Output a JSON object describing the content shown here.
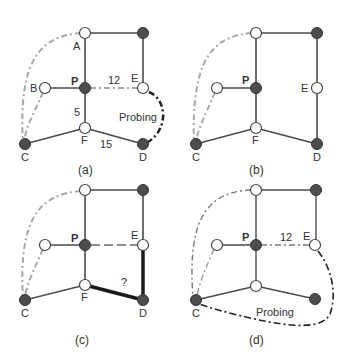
{
  "colors": {
    "edge": "#4a4a4a",
    "edge_thick": "#1a1a1a",
    "dashed_gray": "#a8a8a8",
    "probing": "#222222",
    "node_dark": "#4d4d4d",
    "node_light": "#ffffff",
    "node_stroke": "#444444"
  },
  "panels": [
    {
      "id": "a",
      "caption": "(a)",
      "labels": {
        "A": "A",
        "B": "B",
        "P": "P",
        "E": "E",
        "C": "C",
        "F": "F",
        "D": "D"
      },
      "edge_weights": {
        "P_E": "12",
        "P_F": "5",
        "F_D": "15"
      },
      "annotation": "Probing"
    },
    {
      "id": "b",
      "caption": "(b)",
      "labels": {
        "P": "P",
        "E": "E",
        "C": "C",
        "F": "F",
        "D": "D"
      }
    },
    {
      "id": "c",
      "caption": "(c)",
      "labels": {
        "P": "P",
        "E": "E",
        "C": "C",
        "F": "F",
        "D": "D"
      },
      "annotation": "?"
    },
    {
      "id": "d",
      "caption": "(d)",
      "labels": {
        "P": "P",
        "E": "E",
        "C": "C"
      },
      "edge_weights": {
        "P_E": "12"
      },
      "annotation": "Probing"
    }
  ]
}
